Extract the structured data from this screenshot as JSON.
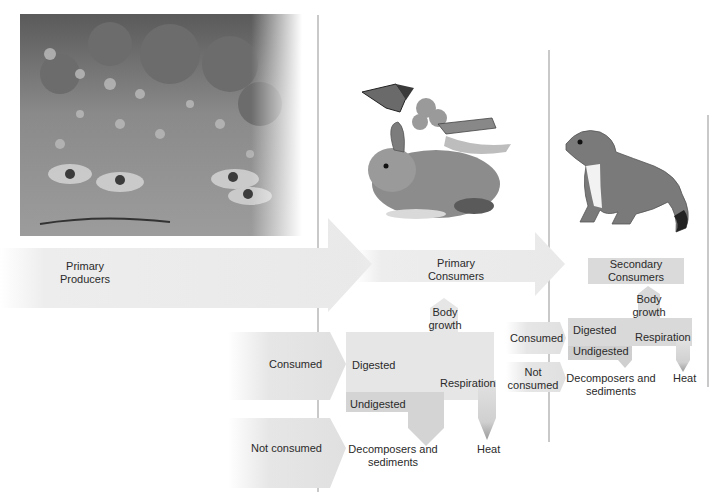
{
  "diagram": {
    "colors": {
      "arrow_light": "#ededed",
      "box_mid": "#dedede",
      "box_dark": "#cfcfcf",
      "divider": "#c9c9c9",
      "text": "#2a2a2a"
    },
    "levels": [
      {
        "name": "Primary Producers",
        "line1": "Primary",
        "line2": "Producers",
        "image": "wildflower-garden-photo"
      },
      {
        "name": "Primary Consumers",
        "line1": "Primary",
        "line2": "Consumers",
        "image": "rabbit-butterfly-grasshopper-illustration"
      },
      {
        "name": "Secondary Consumers",
        "line1": "Secondary",
        "line2": "Consumers",
        "image": "weasel-illustration"
      }
    ],
    "primary_consumer_budget": {
      "consumed": "Consumed",
      "not_consumed": "Not consumed",
      "digested": "Digested",
      "undigested": "Undigested",
      "body_growth_1": "Body",
      "body_growth_2": "growth",
      "respiration": "Respiration",
      "heat": "Heat",
      "decomposers_1": "Decomposers and",
      "decomposers_2": "sediments"
    },
    "secondary_consumer_budget": {
      "consumed": "Consumed",
      "not_consumed_1": "Not",
      "not_consumed_2": "consumed",
      "digested": "Digested",
      "undigested": "Undigested",
      "body_growth_1": "Body",
      "body_growth_2": "growth",
      "respiration": "Respiration",
      "heat": "Heat",
      "decomposers_1": "Decomposers and",
      "decomposers_2": "sediments"
    }
  }
}
